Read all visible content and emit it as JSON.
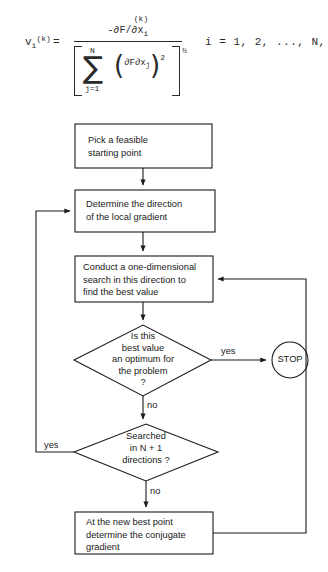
{
  "formula": {
    "lhs_var": "v",
    "lhs_sub": "i",
    "lhs_sup": "(k)",
    "equals": "=",
    "numerator_sup": "(k)",
    "numerator": "-∂F/∂x",
    "numerator_sub": "i",
    "sigma": "∑",
    "sigma_upper": "N",
    "sigma_lower": "j=1",
    "inner_numerator": "∂F",
    "inner_denominator": "∂x",
    "inner_denominator_sub": "j",
    "inner_exponent": "2",
    "outer_exponent": "½",
    "index_range": "i  =  1,  2,  ...,  N,"
  },
  "flowchart": {
    "nodes": [
      {
        "id": "pick-feasible-start",
        "shape": "box",
        "text": "Pick a feasible\nstarting point"
      },
      {
        "id": "determine-direction",
        "shape": "box",
        "text": "Determine the direction\nof the local gradient"
      },
      {
        "id": "one-dimensional-search",
        "shape": "box",
        "text": "Conduct a one-dimensional\nsearch in this direction to\nfind the best value"
      },
      {
        "id": "is-optimum-decision",
        "shape": "diamond",
        "text": "Is this\nbest value\nan optimum for\nthe problem\n?"
      },
      {
        "id": "searched-n-plus-1-decision",
        "shape": "diamond",
        "text": "Searched\nin N + 1\ndirections ?"
      },
      {
        "id": "conjugate-gradient",
        "shape": "box",
        "text": "At the new best point\ndetermine the conjugate\ngradient"
      },
      {
        "id": "stop-terminal",
        "shape": "circle",
        "text": "STOP"
      }
    ],
    "edge_labels": {
      "optimum_yes": "yes",
      "optimum_no": "no",
      "searched_yes": "yes",
      "searched_no": "no"
    },
    "colors": {
      "stroke": "#1a1a1a",
      "background": "#ffffff"
    }
  }
}
